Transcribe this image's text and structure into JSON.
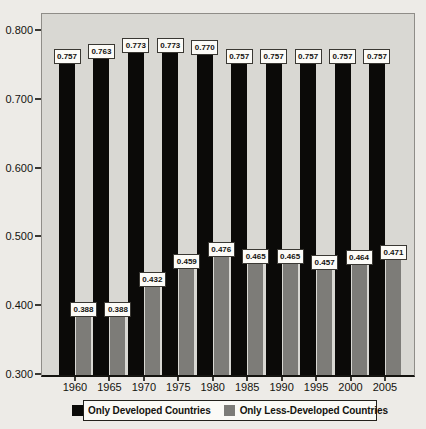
{
  "chart_data": {
    "type": "bar",
    "title": "",
    "xlabel": "",
    "ylabel": "",
    "categories": [
      "1960",
      "1965",
      "1970",
      "1975",
      "1980",
      "1985",
      "1990",
      "1995",
      "2000",
      "2005"
    ],
    "series": [
      {
        "name": "Only Developed Countries",
        "color": "#0b0a08",
        "values": [
          0.757,
          0.763,
          0.773,
          0.773,
          0.77,
          0.757,
          0.757,
          0.757,
          0.757,
          0.757
        ]
      },
      {
        "name": "Only Less-Developed Countries",
        "color": "#7d7c78",
        "values": [
          0.388,
          0.388,
          0.432,
          0.459,
          0.476,
          0.465,
          0.465,
          0.457,
          0.464,
          0.471
        ]
      }
    ],
    "ylim": [
      0.3,
      0.825
    ],
    "yticks": [
      {
        "value": 0.8,
        "label": "0.800"
      },
      {
        "value": 0.7,
        "label": "0.700"
      },
      {
        "value": 0.6,
        "label": "0.600"
      },
      {
        "value": 0.5,
        "label": "0.500"
      },
      {
        "value": 0.4,
        "label": "0.400"
      },
      {
        "value": 0.3,
        "label": "0.300"
      }
    ],
    "grid": false,
    "legend_position": "bottom",
    "value_labels": true,
    "value_label_format": "0.000",
    "plot_background": "#d9d8d3",
    "page_background": "#edebe7"
  }
}
